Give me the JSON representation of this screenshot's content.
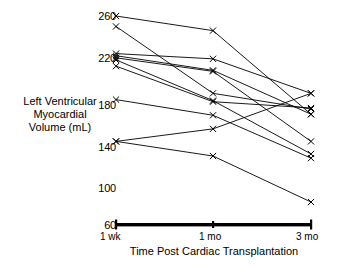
{
  "chart_data": {
    "type": "line",
    "title": "",
    "xlabel": "Time Post Cardiac Transplantation",
    "ylabel": "Left Ventricular Myocardial Volume (mL)",
    "categories": [
      "1 wk",
      "1 mo",
      "3 mo"
    ],
    "yticks": [
      60,
      100,
      140,
      180,
      220,
      260
    ],
    "ylim": [
      60,
      260
    ],
    "grid": false,
    "legend": false,
    "marker": "x",
    "series": [
      {
        "name": "Subject 1",
        "values": [
          260,
          246,
          166
        ]
      },
      {
        "name": "Subject 2",
        "values": [
          250,
          186,
          171
        ]
      },
      {
        "name": "Subject 3",
        "values": [
          224,
          219,
          186
        ]
      },
      {
        "name": "Subject 4",
        "values": [
          222,
          208,
          166
        ]
      },
      {
        "name": "Subject 5",
        "values": [
          220,
          207,
          140
        ]
      },
      {
        "name": "Subject 6",
        "values": [
          218,
          179,
          128
        ]
      },
      {
        "name": "Subject 7",
        "values": [
          212,
          178,
          172
        ]
      },
      {
        "name": "Subject 8",
        "values": [
          180,
          165,
          124
        ]
      },
      {
        "name": "Subject 9",
        "values": [
          140,
          152,
          186
        ]
      },
      {
        "name": "Subject 10",
        "values": [
          140,
          126,
          82
        ]
      }
    ]
  },
  "ytick_labels": {
    "t260": "260",
    "t220": "220",
    "t180": "180",
    "t140": "140",
    "t100": "100",
    "t60": "60"
  },
  "xtick_labels": {
    "x1": "1 wk",
    "x2": "1 mo",
    "x3": "3 mo"
  },
  "axis_titles": {
    "y": "Left Ventricular Myocardial Volume (mL)",
    "x": "Time Post Cardiac Transplantation"
  },
  "colors": {
    "ink": "#000000",
    "background": "#ffffff"
  }
}
